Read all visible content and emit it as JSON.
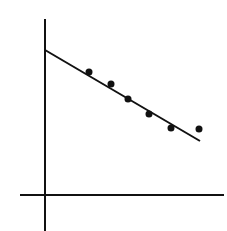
{
  "chart_data": {
    "type": "scatter",
    "title": "",
    "xlabel": "",
    "ylabel": "",
    "grid": false,
    "legend": null,
    "points_px": [
      {
        "x": 89,
        "y": 72
      },
      {
        "x": 111,
        "y": 84
      },
      {
        "x": 128,
        "y": 99
      },
      {
        "x": 149,
        "y": 114
      },
      {
        "x": 171,
        "y": 128
      },
      {
        "x": 199,
        "y": 129
      }
    ],
    "fit_line_px": {
      "x1": 45,
      "y1": 50,
      "x2": 200,
      "y2": 141
    },
    "axes_px": {
      "y_axis": {
        "x": 45,
        "y1": 19,
        "y2": 231
      },
      "x_axis": {
        "y": 195,
        "x1": 20,
        "x2": 224
      }
    },
    "x": [
      1,
      2,
      3,
      4,
      5,
      6
    ],
    "values": [
      5.6,
      5.0,
      4.3,
      3.6,
      3.0,
      2.9
    ],
    "fit": {
      "intercept": 6.6,
      "slope": -0.65
    }
  },
  "colors": {
    "ink": "#111111",
    "background": "#ffffff"
  }
}
